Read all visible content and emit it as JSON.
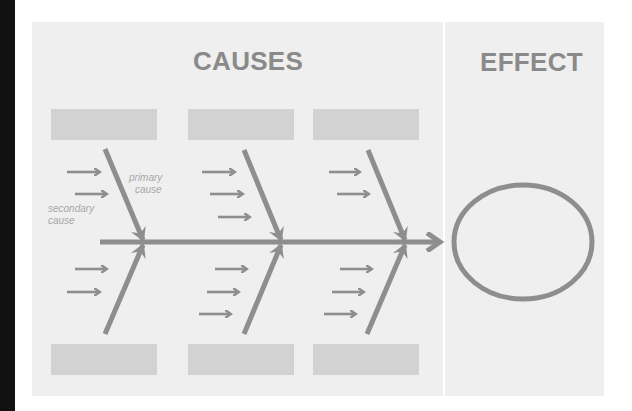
{
  "diagram": {
    "type": "fishbone (Ishikawa) cause-and-effect",
    "titles": {
      "causes": "CAUSES",
      "effect": "EFFECT"
    },
    "labels": {
      "primary_cause": [
        "primary",
        "cause"
      ],
      "secondary_cause": [
        "secondary",
        "cause"
      ]
    },
    "category_boxes": {
      "top": [
        "",
        "",
        ""
      ],
      "bottom": [
        "",
        "",
        ""
      ]
    },
    "branches": [
      {
        "position": "top-1",
        "secondary_arrows": 2
      },
      {
        "position": "top-2",
        "secondary_arrows": 3
      },
      {
        "position": "top-3",
        "secondary_arrows": 2
      },
      {
        "position": "bottom-1",
        "secondary_arrows": 2
      },
      {
        "position": "bottom-2",
        "secondary_arrows": 3
      },
      {
        "position": "bottom-3",
        "secondary_arrows": 3
      }
    ],
    "effect_shape": "ellipse",
    "colors": {
      "panel_background": "#efefef",
      "line": "#8e8e8e",
      "title_text": "#8a8a8a",
      "label_text": "#a8a8a8",
      "box_fill": "#d2d2d2",
      "divider": "#ffffff",
      "left_strip": "#111111"
    }
  }
}
